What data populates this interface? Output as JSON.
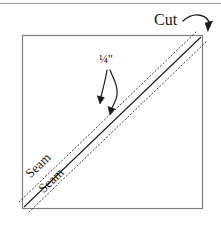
{
  "figure": {
    "type": "sewing-quilting-instruction-diagram",
    "background_color": "#ffffff",
    "ink_color": "#1a1a1a",
    "square_border_color": "#808080",
    "top_rule": {
      "present": true,
      "color": "#999999",
      "y": 3
    }
  },
  "labels": {
    "cut": "Cut",
    "quarter_inch": "¼\"",
    "seam_upper": "Seam",
    "seam_lower": "Seam"
  },
  "icons": {
    "cut_arrow": "curved-arrow-icon",
    "seam_arrow_upper": "curved-arrow-icon",
    "seam_arrow_lower": "curved-arrow-icon"
  },
  "geometry": {
    "square": {
      "x": 22,
      "y": 35,
      "width": 181,
      "height": 174
    },
    "cut_line": {
      "x1": 24,
      "y1": 207,
      "x2": 201,
      "y2": 37,
      "style": "solid"
    },
    "seam_line_upper": {
      "offset_px": -7,
      "style": "dotted"
    },
    "seam_line_lower": {
      "offset_px": 7,
      "style": "dotted"
    }
  }
}
